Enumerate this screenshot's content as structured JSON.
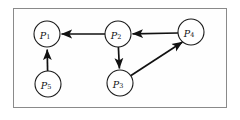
{
  "figure": {
    "title": "",
    "background_color": "#ffffff",
    "frame_color": "#8a8a8a",
    "node_fill": "#ffffff",
    "node_stroke": "#1a1a1a",
    "edge_color": "#111111"
  },
  "graph": {
    "type": "directed-graph",
    "nodes": [
      {
        "id": "P1",
        "label": "P",
        "subscript": "1",
        "cx": 47,
        "cy": 34,
        "r": 13
      },
      {
        "id": "P2",
        "label": "P",
        "subscript": "2",
        "cx": 118,
        "cy": 34,
        "r": 13
      },
      {
        "id": "P3",
        "label": "P",
        "subscript": "3",
        "cx": 120,
        "cy": 83,
        "r": 13
      },
      {
        "id": "P4",
        "label": "P",
        "subscript": "4",
        "cx": 191,
        "cy": 32,
        "r": 13
      },
      {
        "id": "P5",
        "label": "P",
        "subscript": "5",
        "cx": 48,
        "cy": 84,
        "r": 13
      }
    ],
    "edges": [
      {
        "from": "P2",
        "to": "P1",
        "direction": "left",
        "style": "straight"
      },
      {
        "from": "P4",
        "to": "P2",
        "direction": "left",
        "style": "straight"
      },
      {
        "from": "P2",
        "to": "P3",
        "direction": "down",
        "style": "straight"
      },
      {
        "from": "P3",
        "to": "P4",
        "direction": "up-right",
        "style": "diagonal"
      },
      {
        "from": "P5",
        "to": "P1",
        "direction": "up",
        "style": "straight"
      }
    ]
  }
}
